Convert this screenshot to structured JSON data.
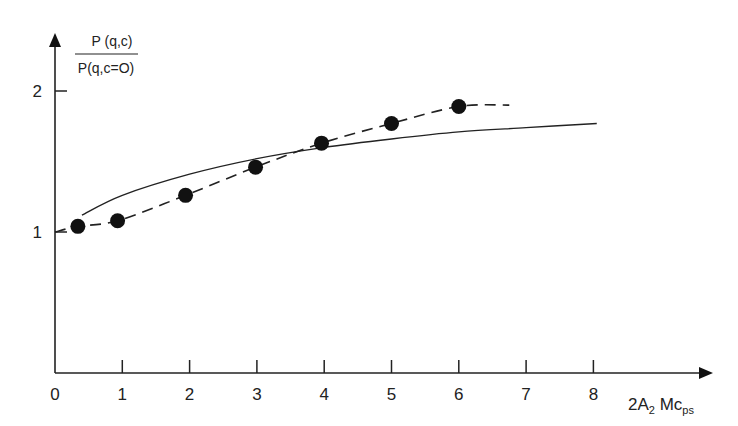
{
  "chart_data": {
    "type": "line",
    "title": "",
    "ylabel_numerator": "P (q,c)",
    "ylabel_denominator": "P(q,c=O)",
    "xlabel": "2A₂ Mc_ps",
    "xlabel_parts": {
      "main": "2A",
      "sub1": "2",
      "mid": " Mc",
      "sub2": "ps"
    },
    "x_ticks": [
      0,
      1,
      2,
      3,
      4,
      5,
      6,
      7,
      8
    ],
    "x_tick_labels": [
      "0",
      "1",
      "2",
      "3",
      "4",
      "5",
      "6",
      "7",
      "8"
    ],
    "y_ticks": [
      1,
      2
    ],
    "y_tick_labels": [
      "1",
      "2"
    ],
    "xlim": [
      0,
      9.6
    ],
    "ylim": [
      0,
      2.4
    ],
    "grid": false,
    "legend": null,
    "series": [
      {
        "name": "experimental points",
        "style": "markers",
        "x": [
          0.34,
          0.93,
          1.94,
          2.98,
          3.96,
          5.0,
          6.0
        ],
        "y": [
          1.04,
          1.08,
          1.26,
          1.46,
          1.63,
          1.77,
          1.89
        ]
      },
      {
        "name": "dashed fit",
        "style": "dashed",
        "x": [
          0,
          0.34,
          0.93,
          1.94,
          2.98,
          3.96,
          5.0,
          6.0,
          6.75
        ],
        "y": [
          1.0,
          1.04,
          1.08,
          1.26,
          1.46,
          1.63,
          1.77,
          1.89,
          1.9
        ]
      },
      {
        "name": "solid theory curve",
        "style": "solid",
        "x": [
          0.4,
          1,
          2,
          3,
          4,
          5,
          6,
          7,
          8.05
        ],
        "y": [
          1.12,
          1.26,
          1.41,
          1.52,
          1.6,
          1.66,
          1.71,
          1.74,
          1.77
        ]
      }
    ]
  }
}
